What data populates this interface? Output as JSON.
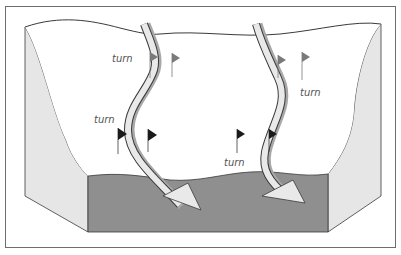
{
  "diagram": {
    "colors": {
      "frame": "#6e6e6e",
      "outline": "#3a3a3a",
      "snow_surface": "#ffffff",
      "side_face": "#e6e6e6",
      "front_face": "#8f8f8f",
      "track_fill": "#e9e9e9",
      "track_shadow": "#a8a8a8",
      "flag_dark": "#1a1a1a",
      "flag_gray": "#7a7a7a"
    },
    "labels": [
      {
        "id": "turn-1",
        "text": "turn",
        "x": 112,
        "y": 58
      },
      {
        "id": "turn-2",
        "text": "turn",
        "x": 94,
        "y": 122
      },
      {
        "id": "turn-3",
        "text": "turn",
        "x": 224,
        "y": 166
      },
      {
        "id": "turn-4",
        "text": "turn",
        "x": 300,
        "y": 96
      }
    ],
    "flags": [
      {
        "id": "flag-1",
        "x": 150,
        "y": 52,
        "tone": "gray"
      },
      {
        "id": "flag-2",
        "x": 172,
        "y": 53,
        "tone": "gray"
      },
      {
        "id": "flag-3",
        "x": 118,
        "y": 128,
        "tone": "dark"
      },
      {
        "id": "flag-4",
        "x": 148,
        "y": 129,
        "tone": "dark"
      },
      {
        "id": "flag-5",
        "x": 237,
        "y": 129,
        "tone": "dark"
      },
      {
        "id": "flag-6",
        "x": 269,
        "y": 129,
        "tone": "dark"
      },
      {
        "id": "flag-7",
        "x": 278,
        "y": 55,
        "tone": "gray"
      },
      {
        "id": "flag-8",
        "x": 302,
        "y": 52,
        "tone": "gray"
      }
    ],
    "tracks": [
      {
        "id": "track-left",
        "label": "ski path left"
      },
      {
        "id": "track-right",
        "label": "ski path right"
      }
    ]
  }
}
